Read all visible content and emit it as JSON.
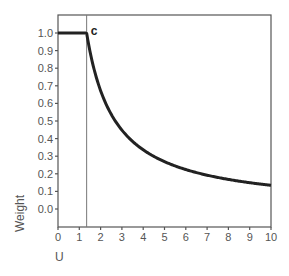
{
  "chart_data": {
    "type": "line",
    "title": "",
    "xlabel": "U",
    "ylabel": "Weight",
    "xlim": [
      0,
      10
    ],
    "ylim": [
      0.0,
      1.0
    ],
    "grid": false,
    "legend": null,
    "x_ticks": [
      "0",
      "1",
      "2",
      "3",
      "4",
      "5",
      "6",
      "7",
      "8",
      "9",
      "10"
    ],
    "y_ticks": [
      "1.0",
      "0.9",
      "0.8",
      "0.7",
      "0.6",
      "0.5",
      "0.4",
      "0.3",
      "0.2",
      "0.1",
      "0.0"
    ],
    "annotations": [
      {
        "text": "c",
        "x": 1.345,
        "y": 1.0,
        "note": "vertical reference line at u = c"
      }
    ],
    "reference_line": {
      "orientation": "vertical",
      "x": 1.345
    },
    "series": [
      {
        "name": "Weight",
        "description": "w(u) = 1 for u <= c; w(u) = c/u for u > c (c = 1.345)",
        "x": [
          0,
          1.345,
          1.5,
          2,
          2.5,
          3,
          3.5,
          4,
          4.5,
          5,
          6,
          7,
          8,
          9,
          10
        ],
        "values": [
          1.0,
          1.0,
          0.897,
          0.673,
          0.538,
          0.448,
          0.384,
          0.336,
          0.299,
          0.269,
          0.224,
          0.192,
          0.168,
          0.149,
          0.135
        ]
      }
    ]
  }
}
